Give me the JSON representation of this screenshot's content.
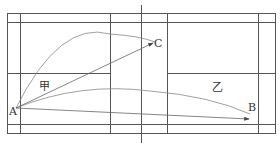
{
  "diagram": {
    "title": "",
    "labels": {
      "point_a": "A",
      "point_b": "B",
      "point_c": "C",
      "zone_jia": "甲",
      "zone_yi": "乙"
    },
    "colors": {
      "court_lines": "#555555",
      "trajectory": "#888888",
      "arrow": "#666666",
      "text": "#333333"
    }
  }
}
